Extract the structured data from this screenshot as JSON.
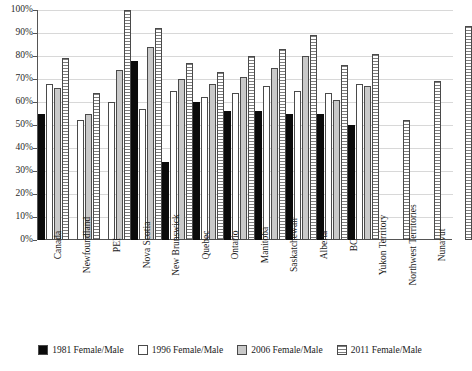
{
  "chart_data": {
    "type": "bar",
    "title": "",
    "subtitle": "",
    "xlabel": "",
    "ylabel": "",
    "ylim": [
      0,
      100
    ],
    "y_tick_labels": [
      "100%",
      "90%",
      "80%",
      "70%",
      "60%",
      "50%",
      "40%",
      "30%",
      "20%",
      "10%",
      "0%"
    ],
    "y_tick_values": [
      100,
      90,
      80,
      70,
      60,
      50,
      40,
      30,
      20,
      10,
      0
    ],
    "grid": true,
    "legend_position": "bottom",
    "value_unit": "%",
    "categories": [
      "Canada",
      "Newfoundland",
      "PEI",
      "Nova Scotia",
      "New Brunswick",
      "Quebec",
      "Ontario",
      "Manitoba",
      "Saskatchewan",
      "Alberta",
      "BC",
      "Yukon Territory",
      "Northwest Territories",
      "Nunavut"
    ],
    "series": [
      {
        "name": "1981 Female/Male",
        "fill": "solid-black",
        "color": "#0b0b0b",
        "values": [
          55,
          null,
          null,
          78,
          34,
          60,
          56,
          56,
          55,
          55,
          50,
          null,
          null,
          null
        ]
      },
      {
        "name": "1996 Female/Male",
        "fill": "solid-white",
        "color": "#ffffff",
        "values": [
          68,
          52,
          60,
          57,
          65,
          62,
          64,
          67,
          65,
          64,
          68,
          null,
          null,
          null
        ]
      },
      {
        "name": "2006 Female/Male",
        "fill": "solid-gray",
        "color": "#c9c9c9",
        "values": [
          66,
          55,
          74,
          84,
          70,
          68,
          71,
          75,
          80,
          61,
          67,
          null,
          null,
          null
        ]
      },
      {
        "name": "2011 Female/Male",
        "fill": "horizontal-hatch",
        "color": "#f2f2f2",
        "values": [
          79,
          64,
          100,
          92,
          77,
          73,
          80,
          83,
          89,
          76,
          81,
          52,
          69,
          93
        ]
      }
    ]
  },
  "legend": {
    "items": [
      {
        "label": "1981 Female/Male",
        "swatch": "solid-black"
      },
      {
        "label": "1996 Female/Male",
        "swatch": "solid-white"
      },
      {
        "label": "2006 Female/Male",
        "swatch": "solid-gray"
      },
      {
        "label": "2011 Female/Male",
        "swatch": "horizontal-hatch"
      }
    ]
  }
}
